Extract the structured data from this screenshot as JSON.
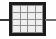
{
  "canvas": {
    "width": 56,
    "height": 39,
    "background_color": "#fefefe"
  },
  "icon": {
    "name": "grid-mesh-inline-symbol",
    "description": "Square mesh grid element with horizontal conductor leads on left and right",
    "border_color": "#1c1c1c",
    "gridline_color": "#8e8e8e",
    "cell_color": "#efefef",
    "lead_color": "#3a3a3a",
    "lead_color_right": "#707070",
    "grid": {
      "columns": 4,
      "rows": 4,
      "cells": [
        [
          1,
          2,
          3,
          4
        ],
        [
          5,
          6,
          7,
          8
        ],
        [
          9,
          10,
          11,
          12
        ],
        [
          13,
          14,
          15,
          16
        ]
      ]
    },
    "leads": [
      {
        "side": "left",
        "label": ""
      },
      {
        "side": "right",
        "label": ""
      }
    ]
  }
}
